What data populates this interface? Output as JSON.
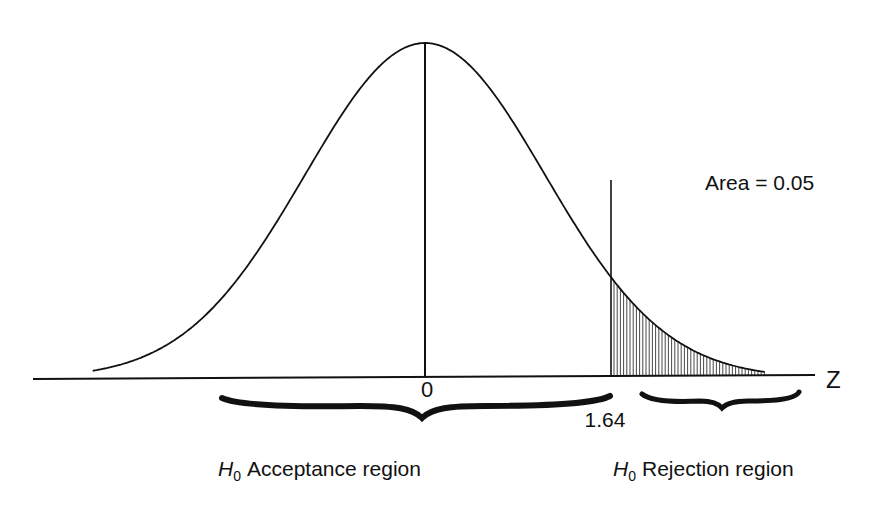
{
  "chart_data": {
    "type": "area",
    "title": "",
    "distribution": "standard normal",
    "x_axis_label": "Z",
    "x_range": [
      -2.93,
      3.0
    ],
    "mean_label": "0",
    "mean": 0,
    "critical_value": 1.64,
    "critical_value_label": "1.64",
    "shaded_region": {
      "from": 1.64,
      "to": 3.0,
      "pattern": "vertical-hatch"
    },
    "annotations": {
      "area": "Area = 0.05",
      "acceptance": {
        "subscript_symbol": "H",
        "subscript": "0",
        "text": "Acceptance region"
      },
      "rejection": {
        "subscript_symbol": "H",
        "subscript": "0",
        "text": "Rejection region"
      }
    },
    "colors": {
      "ink": "#111111",
      "background": "#ffffff"
    }
  }
}
